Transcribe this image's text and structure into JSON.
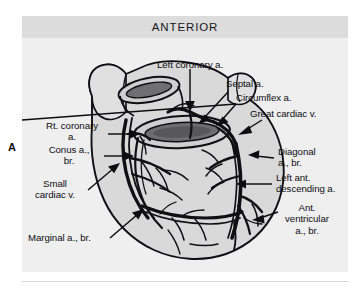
{
  "figure": {
    "panel_letter": "A",
    "orientation_header": "ANTERIOR",
    "colors": {
      "panel_background": "#efeff0",
      "header_band": "#dcdcdd",
      "ink": "#0d0d10",
      "myocardium_fill": "#d7d7d8",
      "vessel_lumen": "#6f6f71",
      "page_background": "#ffffff"
    }
  },
  "labels": [
    {
      "id": "left-coronary-a",
      "text": "Left coronary a."
    },
    {
      "id": "septal-a",
      "text": "Septal a."
    },
    {
      "id": "circumflex-a",
      "text": "Circumflex a."
    },
    {
      "id": "great-cardiac-v",
      "text": "Great cardiac v."
    },
    {
      "id": "diagonal-a-br",
      "text": "Diagonal\na., br."
    },
    {
      "id": "left-ant-descending-a",
      "text": "Left ant.\ndescending a."
    },
    {
      "id": "ant-ventricular-a-br",
      "text": "Ant.\nventricular\na., br."
    },
    {
      "id": "rt-coronary-a",
      "text": "Rt. coronary\na."
    },
    {
      "id": "conus-a-br",
      "text": "Conus a.,\nbr."
    },
    {
      "id": "small-cardiac-v",
      "text": "Small\ncardiac v."
    },
    {
      "id": "marginal-a-br",
      "text": "Marginal a., br."
    }
  ]
}
